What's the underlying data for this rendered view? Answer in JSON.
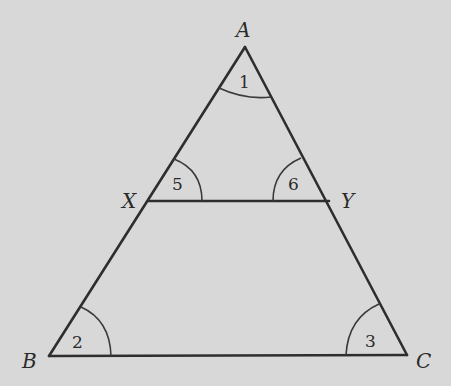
{
  "diagram": {
    "background": "#d8d8d8",
    "stroke_color": "#2e2e2e",
    "vertices": {
      "A": {
        "label": "A",
        "x": 245,
        "y": 47
      },
      "B": {
        "label": "B",
        "x": 49,
        "y": 356
      },
      "C": {
        "label": "C",
        "x": 407,
        "y": 355
      },
      "X": {
        "label": "X",
        "x": 148,
        "y": 201
      },
      "Y": {
        "label": "Y",
        "x": 329,
        "y": 201
      }
    },
    "segments": [
      "AB",
      "AC",
      "BC",
      "XY"
    ],
    "angles": [
      {
        "label": "1",
        "vertex": "A"
      },
      {
        "label": "2",
        "vertex": "B"
      },
      {
        "label": "3",
        "vertex": "C"
      },
      {
        "label": "5",
        "vertex": "X"
      },
      {
        "label": "6",
        "vertex": "Y"
      }
    ]
  }
}
